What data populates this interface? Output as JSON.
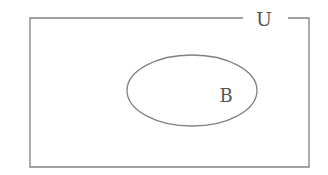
{
  "diagram": {
    "type": "venn",
    "universe": {
      "label": "U"
    },
    "sets": [
      {
        "label": "B"
      }
    ],
    "stroke_color": "#808080",
    "label_color": "#555555"
  }
}
